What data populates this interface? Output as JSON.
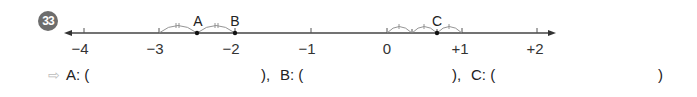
{
  "problem": {
    "number": "33",
    "badge_color": "#6d6d6d"
  },
  "number_line": {
    "ticks": [
      {
        "label": "−4",
        "value": -4,
        "x": 84
      },
      {
        "label": "−3",
        "value": -3,
        "x": 159
      },
      {
        "label": "−2",
        "value": -2,
        "x": 235
      },
      {
        "label": "−1",
        "value": -1,
        "x": 311
      },
      {
        "label": "0",
        "value": 0,
        "x": 387
      },
      {
        "label": "+1",
        "value": 1,
        "x": 462
      },
      {
        "label": "+2",
        "value": 2,
        "x": 537
      }
    ],
    "points": [
      {
        "label": "A",
        "position_note": "midpoint between −3 and −2 split into 2 equal parts"
      },
      {
        "label": "B",
        "position_note": "at −2"
      },
      {
        "label": "C",
        "position_note": "2 of 3 equal parts from 0 to +1"
      }
    ]
  },
  "answers": {
    "arrow_icon": "⇨",
    "a_label": "A: (",
    "a_close": "),",
    "b_label": "B: (",
    "b_close": "),",
    "c_label": "C: (",
    "c_close": ")"
  }
}
